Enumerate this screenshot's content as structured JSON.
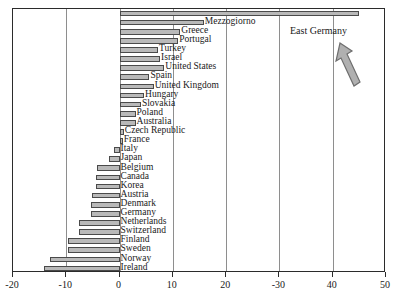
{
  "chart_data": {
    "type": "bar",
    "orientation": "horizontal",
    "title": "",
    "xlabel": "",
    "ylabel": "",
    "xlim": [
      -20,
      50
    ],
    "xticks": [
      -20,
      -10,
      0,
      10,
      20,
      30,
      40,
      50
    ],
    "xtick_labels": [
      "-20",
      "-10",
      "0",
      "10",
      "20",
      "-30",
      "40",
      "50"
    ],
    "grid": true,
    "grid_axis": "x",
    "legend": "none",
    "categories": [
      "East Germany",
      "Mezzogiorno",
      "Greece",
      "Portugal",
      "Turkey",
      "Israel",
      "United States",
      "Spain",
      "United Kingdom",
      "Hungary",
      "Slovakia",
      "Poland",
      "Australia",
      "Czech Republic",
      "France",
      "Italy",
      "Japan",
      "Belgium",
      "Canada",
      "Korea",
      "Austria",
      "Denmark",
      "Germany",
      "Netherlands",
      "Switzerland",
      "Finland",
      "Sweden",
      "Norway",
      "Ireland"
    ],
    "values": [
      45.0,
      15.8,
      11.4,
      11.0,
      7.2,
      7.6,
      8.4,
      5.6,
      6.4,
      4.6,
      4.0,
      3.0,
      3.0,
      0.8,
      0.6,
      -1.0,
      -2.0,
      -4.2,
      -4.4,
      -4.4,
      -5.2,
      -5.4,
      -5.4,
      -7.6,
      -7.6,
      -9.6,
      -9.6,
      -13.1,
      -14.1
    ],
    "annotations": [
      {
        "name": "east-germany-callout",
        "text": "East Germany",
        "points_to": "East Germany",
        "arrow": true
      }
    ]
  },
  "colors": {
    "bar_fill": "#b9b9b9",
    "bar_stroke": "#4a4a4a",
    "frame": "#2b2b2b",
    "gridline": "#8e8e8e",
    "text": "#1a1a1a",
    "arrow_fill": "#b0b0b0",
    "arrow_stroke": "#6e6e6e",
    "background": "#ffffff"
  }
}
